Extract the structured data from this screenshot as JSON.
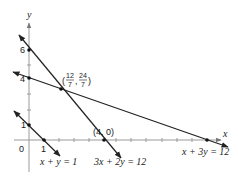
{
  "figure": {
    "axes": {
      "x_label": "x",
      "y_label": "y",
      "origin_label": "0",
      "y_tick_labels": [
        "6",
        "4",
        "1"
      ],
      "x_tick_labels": [
        "1"
      ]
    },
    "lines": [
      {
        "equation": "x + y = 1",
        "label": "x + y = 1"
      },
      {
        "equation": "3x + 2y = 12",
        "label": "3x + 2y = 12"
      },
      {
        "equation": "x + 3y = 12",
        "label": "x + 3y = 12"
      }
    ],
    "points": [
      {
        "coords": "(0, 6)"
      },
      {
        "coords": "(0, 4)"
      },
      {
        "coords": "(0, 1)"
      },
      {
        "coords": "(1, 0)"
      },
      {
        "coords": "(4, 0)",
        "label": "(4, 0)"
      },
      {
        "coords": "(12/7, 24/7)",
        "label_open": "(",
        "label_num1": "12",
        "label_den1": "7",
        "label_sep": ",",
        "label_num2": "24",
        "label_den2": "7",
        "label_close": ")"
      },
      {
        "coords": "(12, 0)"
      }
    ],
    "colors": {
      "axis": "#9a9a9a",
      "line": "#222222",
      "background": "#ffffff"
    }
  }
}
